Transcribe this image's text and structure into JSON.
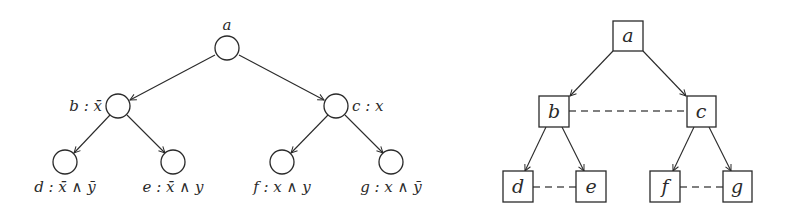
{
  "left_tree": {
    "nodes": [
      {
        "id": "a",
        "label": "a",
        "cx": 227,
        "cy": 48
      },
      {
        "id": "b",
        "label": "b : x̄",
        "cx": 118,
        "cy": 106
      },
      {
        "id": "c",
        "label": "c : x",
        "cx": 336,
        "cy": 106
      },
      {
        "id": "d",
        "label": "d : x̄ ∧ ȳ",
        "cx": 65,
        "cy": 162
      },
      {
        "id": "e",
        "label": "e : x̄ ∧ y",
        "cx": 173,
        "cy": 162
      },
      {
        "id": "f",
        "label": "f : x ∧ y",
        "cx": 282,
        "cy": 162
      },
      {
        "id": "g",
        "label": "g : x ∧ ȳ",
        "cx": 391,
        "cy": 162
      }
    ],
    "edges": [
      [
        "a",
        "b"
      ],
      [
        "a",
        "c"
      ],
      [
        "b",
        "d"
      ],
      [
        "b",
        "e"
      ],
      [
        "c",
        "f"
      ],
      [
        "c",
        "g"
      ]
    ]
  },
  "right_tree": {
    "nodes": [
      {
        "id": "a",
        "label": "a"
      },
      {
        "id": "b",
        "label": "b"
      },
      {
        "id": "c",
        "label": "c"
      },
      {
        "id": "d",
        "label": "d"
      },
      {
        "id": "e",
        "label": "e"
      },
      {
        "id": "f",
        "label": "f"
      },
      {
        "id": "g",
        "label": "g"
      }
    ],
    "edges": [
      [
        "a",
        "b"
      ],
      [
        "a",
        "c"
      ],
      [
        "b",
        "d"
      ],
      [
        "b",
        "e"
      ],
      [
        "c",
        "f"
      ],
      [
        "c",
        "g"
      ]
    ],
    "dashed_links": [
      [
        "b",
        "c"
      ],
      [
        "d",
        "e"
      ],
      [
        "f",
        "g"
      ]
    ]
  },
  "colors": {
    "stroke": "#2a2a2a",
    "dashed": "#555555",
    "background": "#ffffff"
  }
}
